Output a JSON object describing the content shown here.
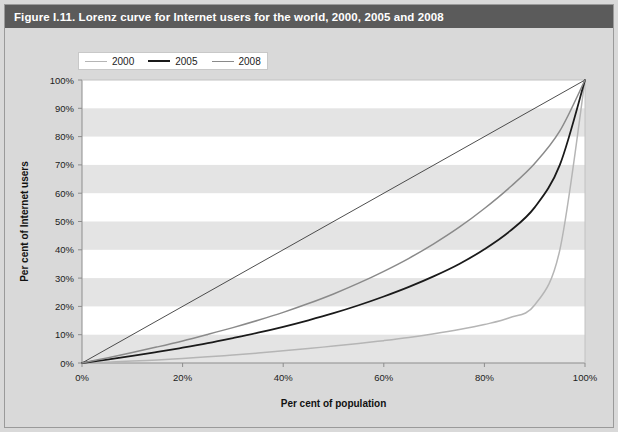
{
  "figure": {
    "title": "Figure I.11. Lorenz curve for Internet users for the world, 2000, 2005 and 2008",
    "title_bar_color": "#5b5b5b",
    "page_background": "#d9d9d9",
    "plot_background": "#ffffff",
    "band_color": "#e4e4e4"
  },
  "legend": {
    "position": "top-left",
    "entries": [
      {
        "label": "2000",
        "color": "#b5b5b5"
      },
      {
        "label": "2005",
        "color": "#1a1a1a"
      },
      {
        "label": "2008",
        "color": "#8a8a8a"
      }
    ]
  },
  "chart_data": {
    "type": "line",
    "title": "Figure I.11. Lorenz curve for Internet users for the world, 2000, 2005 and 2008",
    "xlabel": "Per cent of population",
    "ylabel": "Per cent of Internet users",
    "xlim": [
      0,
      100
    ],
    "ylim": [
      0,
      100
    ],
    "grid": false,
    "banded_background": true,
    "legend_position": "top-left",
    "xticks": [
      0,
      20,
      40,
      60,
      80,
      100
    ],
    "xticklabels": [
      "0%",
      "20%",
      "40%",
      "60%",
      "80%",
      "100%"
    ],
    "yticks": [
      0,
      10,
      20,
      30,
      40,
      50,
      60,
      70,
      80,
      90,
      100
    ],
    "yticklabels": [
      "0%",
      "10%",
      "20%",
      "30%",
      "40%",
      "50%",
      "60%",
      "70%",
      "80%",
      "90%",
      "100%"
    ],
    "reference_line": {
      "name": "line-of-equality",
      "x": [
        0,
        100
      ],
      "y": [
        0,
        100
      ],
      "color": "#3a3a3a"
    },
    "x": [
      0,
      5,
      10,
      15,
      20,
      25,
      30,
      35,
      40,
      45,
      50,
      55,
      60,
      65,
      70,
      75,
      80,
      85,
      90,
      95,
      100
    ],
    "series": [
      {
        "name": "2000",
        "color": "#b5b5b5",
        "values": [
          0,
          0.3,
          0.7,
          1.1,
          1.6,
          2.2,
          2.8,
          3.5,
          4.3,
          5.1,
          6.0,
          6.9,
          7.9,
          9.0,
          10.3,
          11.8,
          13.6,
          16.0,
          20.5,
          40.0,
          100
        ]
      },
      {
        "name": "2005",
        "color": "#1a1a1a",
        "values": [
          0,
          1.2,
          2.5,
          3.9,
          5.4,
          7.0,
          8.8,
          10.7,
          12.8,
          15.1,
          17.6,
          20.4,
          23.5,
          26.9,
          30.7,
          35.0,
          40.2,
          46.5,
          55.0,
          70.0,
          100
        ]
      },
      {
        "name": "2008",
        "color": "#8a8a8a",
        "values": [
          0,
          1.8,
          3.7,
          5.7,
          7.8,
          10.1,
          12.5,
          15.1,
          17.9,
          21.0,
          24.4,
          28.2,
          32.4,
          37.0,
          42.2,
          48.0,
          54.6,
          62.0,
          70.5,
          82.0,
          100
        ]
      }
    ]
  }
}
